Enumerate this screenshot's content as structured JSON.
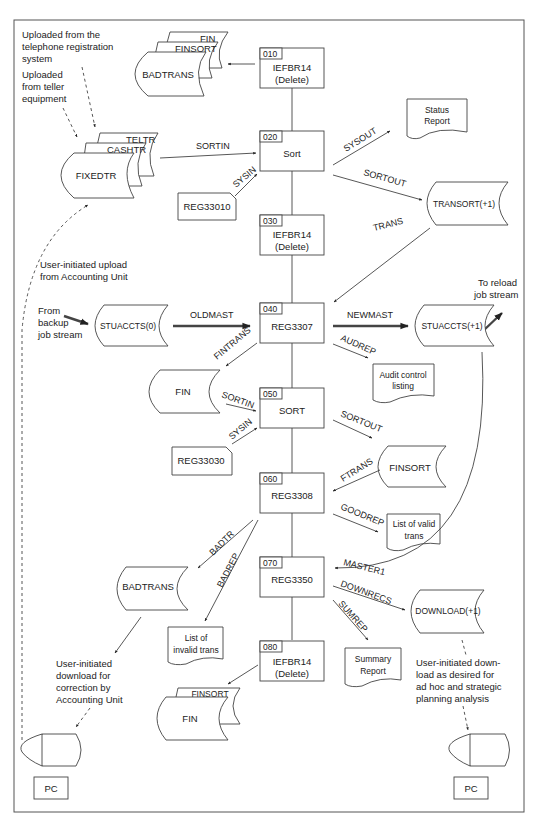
{
  "header": {
    "running_text": ""
  },
  "notes": {
    "telephone": [
      "Uploaded from the",
      "telephone registration",
      "system"
    ],
    "teller": [
      "Uploaded",
      "from teller",
      "equipment"
    ],
    "accounting_upload": [
      "User-initiated upload",
      "from Accounting Unit"
    ],
    "backup": [
      "From",
      "backup",
      "job stream"
    ],
    "reload": [
      "To reload",
      "job stream"
    ],
    "correction_download": [
      "User-initiated",
      "download for",
      "correction by",
      "Accounting Unit"
    ],
    "adhoc_download": [
      "User-initiated down-",
      "load as desired for",
      "ad hoc and strategic",
      "planning analysis"
    ]
  },
  "steps": [
    {
      "id": "s010",
      "num": "010",
      "program": "IEFBR14",
      "sub": "(Delete)"
    },
    {
      "id": "s020",
      "num": "020",
      "program": "Sort",
      "sub": ""
    },
    {
      "id": "s030",
      "num": "030",
      "program": "IEFBR14",
      "sub": "(Delete)"
    },
    {
      "id": "s040",
      "num": "040",
      "program": "REG3307",
      "sub": ""
    },
    {
      "id": "s050",
      "num": "050",
      "program": "SORT",
      "sub": ""
    },
    {
      "id": "s060",
      "num": "060",
      "program": "REG3308",
      "sub": ""
    },
    {
      "id": "s070",
      "num": "070",
      "program": "REG3350",
      "sub": ""
    },
    {
      "id": "s080",
      "num": "080",
      "program": "IEFBR14",
      "sub": "(Delete)"
    }
  ],
  "files": {
    "delete1": {
      "back2": "FIN",
      "back1": "FINSORT",
      "front": "BADTRANS"
    },
    "input": {
      "back2": "TELTR",
      "back1": "CASHTR",
      "front": "FIXEDTR"
    },
    "transort": "TRANSORT(+1)",
    "stuaccts_old": "STUACCTS(0)",
    "stuaccts_new": "STUACCTS(+1)",
    "fin": "FIN",
    "finsort": "FINSORT",
    "badtrans": "BADTRANS",
    "download": "DOWNLOAD(+1)",
    "delete2": {
      "back1": "FINSORT",
      "front": "FIN"
    }
  },
  "cards": {
    "reg33010": "REG33010",
    "reg33030": "REG33030"
  },
  "reports": {
    "status": [
      "Status",
      "Report"
    ],
    "audit": [
      "Audit control",
      "listing"
    ],
    "valid": [
      "List of valid",
      "trans"
    ],
    "invalid": [
      "List of",
      "invalid trans"
    ],
    "summary": [
      "Summary",
      "Report"
    ]
  },
  "ddnames": {
    "sortin1": "SORTIN",
    "sysin1": "SYSIN",
    "sysout": "SYSOUT",
    "sortout1": "SORTOUT",
    "trans": "TRANS",
    "oldmast": "OLDMAST",
    "newmast": "NEWMAST",
    "audrep": "AUDREP",
    "fintrans": "FINTRANS",
    "sortin2": "SORTIN",
    "sysin2": "SYSIN",
    "sortout2": "SORTOUT",
    "ftrans": "FTRANS",
    "goodrep": "GOODREP",
    "badtr": "BADTR",
    "badrep": "BADREP",
    "master1": "MASTER1",
    "downrecs": "DOWNRECS",
    "sumrep": "SUMREP"
  },
  "terminals": {
    "left": "PC",
    "right": "PC"
  }
}
